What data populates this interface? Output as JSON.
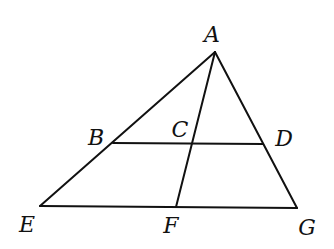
{
  "diagram": {
    "type": "geometry",
    "stroke_color": "#111111",
    "background": "#ffffff",
    "points": {
      "A": {
        "label": "A",
        "x": 215,
        "y": 52,
        "label_x": 212,
        "label_y": 42
      },
      "B": {
        "label": "B",
        "x": 113,
        "y": 143,
        "label_x": 96,
        "label_y": 145
      },
      "C": {
        "label": "C",
        "x": 192,
        "y": 143,
        "label_x": 180,
        "label_y": 137
      },
      "D": {
        "label": "D",
        "x": 263,
        "y": 144,
        "label_x": 284,
        "label_y": 146
      },
      "E": {
        "label": "E",
        "x": 40,
        "y": 206,
        "label_x": 27,
        "label_y": 232
      },
      "F": {
        "label": "F",
        "x": 176,
        "y": 207,
        "label_x": 171,
        "label_y": 233
      },
      "G": {
        "label": "G",
        "x": 297,
        "y": 208,
        "label_x": 307,
        "label_y": 235
      }
    },
    "segments": [
      {
        "from": "A",
        "to": "E"
      },
      {
        "from": "A",
        "to": "G"
      },
      {
        "from": "E",
        "to": "G"
      },
      {
        "from": "B",
        "to": "D"
      },
      {
        "from": "A",
        "to": "F"
      }
    ]
  }
}
